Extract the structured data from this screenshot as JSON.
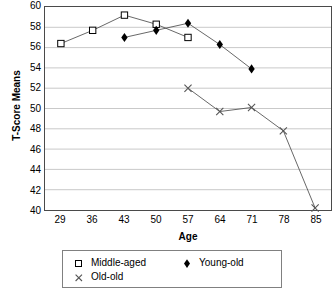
{
  "chart_data": {
    "type": "line",
    "title": "",
    "xlabel": "Age",
    "ylabel": "T-Score Means",
    "x": [
      29,
      36,
      43,
      50,
      57,
      64,
      71,
      78,
      85
    ],
    "xlim": [
      25.5,
      88.5
    ],
    "ylim": [
      40,
      60
    ],
    "ytick_step": 2,
    "grid": "horizontal",
    "legend_position": "bottom",
    "series": [
      {
        "name": "Middle-aged",
        "marker": "open-square",
        "color": "#000000",
        "x": [
          29,
          36,
          43,
          50,
          57
        ],
        "values": [
          56.4,
          57.7,
          59.2,
          58.3,
          57.0
        ]
      },
      {
        "name": "Young-old",
        "marker": "filled-diamond",
        "color": "#000000",
        "x": [
          43,
          50,
          57,
          64,
          71
        ],
        "values": [
          57.0,
          57.7,
          58.4,
          56.3,
          53.9
        ]
      },
      {
        "name": "Old-old",
        "marker": "cross-x",
        "color": "#000000",
        "x": [
          57,
          64,
          71,
          78,
          85
        ],
        "values": [
          52.0,
          49.7,
          50.1,
          47.8,
          40.2
        ]
      }
    ],
    "ytick_labels": [
      "60",
      "58",
      "56",
      "54",
      "52",
      "50",
      "48",
      "46",
      "44",
      "42",
      "40"
    ],
    "xtick_labels": [
      "29",
      "36",
      "43",
      "50",
      "57",
      "64",
      "71",
      "78",
      "85"
    ]
  },
  "legend": {
    "entries": [
      {
        "label": "Middle-aged",
        "marker": "open-square"
      },
      {
        "label": "Old-old",
        "marker": "cross-x"
      },
      {
        "label": "Young-old",
        "marker": "filled-diamond"
      }
    ]
  },
  "axes": {
    "x_title": "Age",
    "y_title": "T-Score Means"
  },
  "style": {
    "frame_color": "#4a4a4a",
    "grid_color": "#c8c8c8",
    "line_color": "#555555",
    "marker_color": "#000000",
    "legend_border_color": "#808080",
    "background": "#ffffff"
  }
}
